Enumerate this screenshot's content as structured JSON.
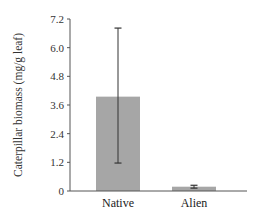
{
  "chart_data": {
    "type": "bar",
    "title": "",
    "xlabel": "",
    "ylabel": "Caterpillar biomass (mg/g leaf)",
    "categories": [
      "Native",
      "Alien"
    ],
    "values": [
      3.95,
      0.18
    ],
    "error_bars": {
      "upper": [
        6.82,
        0.24
      ],
      "lower": [
        1.17,
        0.12
      ]
    },
    "ylim": [
      0,
      7.2
    ],
    "yticks": [
      0,
      1.2,
      2.4,
      3.6,
      4.8,
      6.0,
      7.2
    ],
    "ytick_labels": [
      "0",
      "1.2",
      "2.4",
      "3.6",
      "4.8",
      "6.0",
      "7.2"
    ],
    "grid": false,
    "legend": null,
    "colors": {
      "bar": "#a6a6a6",
      "axis": "#555555",
      "error": "#333333"
    }
  }
}
